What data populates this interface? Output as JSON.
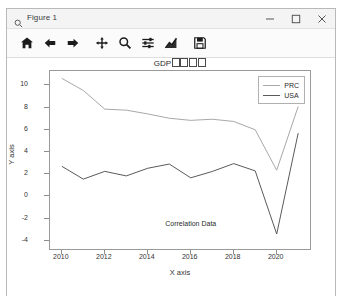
{
  "window": {
    "title": "Figure 1",
    "icon": "magnifier-icon",
    "controls": {
      "minimize": "minimize-icon",
      "maximize": "maximize-icon",
      "close": "close-icon"
    }
  },
  "toolbar": {
    "buttons": [
      {
        "name": "home-button",
        "icon": "home-icon",
        "tooltip": "Reset original view"
      },
      {
        "name": "back-button",
        "icon": "arrow-left-icon",
        "tooltip": "Back to previous view"
      },
      {
        "name": "forward-button",
        "icon": "arrow-right-icon",
        "tooltip": "Forward to next view"
      },
      {
        "name": "pan-button",
        "icon": "move-icon",
        "tooltip": "Pan axes with left mouse, zoom with right"
      },
      {
        "name": "zoom-button",
        "icon": "magnifier-icon",
        "tooltip": "Zoom to rectangle"
      },
      {
        "name": "configure-subplots-button",
        "icon": "sliders-icon",
        "tooltip": "Configure subplots"
      },
      {
        "name": "edit-axis-button",
        "icon": "curve-icon",
        "tooltip": "Edit axis, curve and image parameters"
      },
      {
        "name": "save-button",
        "icon": "floppy-disk-icon",
        "tooltip": "Save the figure"
      }
    ]
  },
  "chart_data": {
    "type": "line",
    "title": "GDP",
    "title_unrendered_glyphs": 4,
    "xlabel": "X axis",
    "ylabel": "Y axis",
    "x": [
      2010,
      2011,
      2012,
      2013,
      2014,
      2015,
      2016,
      2017,
      2018,
      2019,
      2020,
      2021
    ],
    "xlim": [
      2009.45,
      2021.55
    ],
    "ylim": [
      -4.75,
      11.3
    ],
    "xticks": [
      2010,
      2012,
      2014,
      2016,
      2018,
      2020
    ],
    "yticks": [
      10,
      8,
      6,
      4,
      2,
      0,
      -2,
      -4
    ],
    "grid": false,
    "legend_position": "upper right",
    "annotations": [
      {
        "text": "Correlation Data",
        "x": 2016.0,
        "y": -2.55
      }
    ],
    "series": [
      {
        "name": "PRC",
        "color": "#a8a8a8",
        "values": [
          10.64,
          9.55,
          7.86,
          7.77,
          7.43,
          7.04,
          6.85,
          6.95,
          6.75,
          6.0,
          2.35,
          8.1
        ]
      },
      {
        "name": "USA",
        "color": "#5a5a5a",
        "values": [
          2.71,
          1.55,
          2.25,
          1.84,
          2.53,
          2.91,
          1.67,
          2.24,
          2.95,
          2.29,
          -3.4,
          5.7
        ]
      }
    ]
  }
}
